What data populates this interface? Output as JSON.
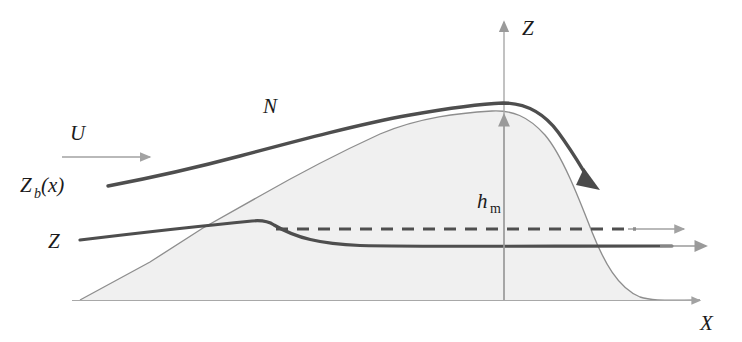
{
  "figure": {
    "kind": "schematic-diagram",
    "topic": "mountain-wave airflow over a ridge",
    "background_color": "#ffffff",
    "colors": {
      "streamline_dark": "#4a4a4a",
      "streamline_thick": "#555555",
      "terrain_outline": "#8a8a8a",
      "terrain_fill": "#f0f0f0",
      "axis_gray": "#9a9a9a",
      "label_text": "#1b1b1b",
      "dashed_line": "#4f4f4f"
    }
  },
  "labels": {
    "z_axis": "Z",
    "x_axis": "X",
    "wind_speed": "U",
    "brunt_vaisala": "N",
    "upper_streamline": "Z",
    "upper_streamline_sub": "b",
    "upper_streamline_arg": "(x)",
    "lower_streamline": "Z",
    "mountain_height": "h",
    "mountain_height_sub": "m"
  },
  "elements": {
    "z_axis_arrow": "vertical-axis-arrow",
    "x_axis_arrow": "horizontal-axis-arrow",
    "wind_arrow": "wind-direction-arrow",
    "height_arrow": "mountain-height-arrow",
    "plunge_arrow": "downslope-plunge-arrow",
    "outflow_arrow_upper": "upper-outflow-arrow",
    "outflow_arrow_lower": "lower-outflow-arrow",
    "terrain": "mountain-profile",
    "dashed_reference": "undisturbed-streamline-level"
  },
  "geometry": {
    "baseline_y": 300,
    "peak_x": 505,
    "peak_y": 112,
    "terrain_left_x": 80,
    "terrain_right_x": 700
  }
}
